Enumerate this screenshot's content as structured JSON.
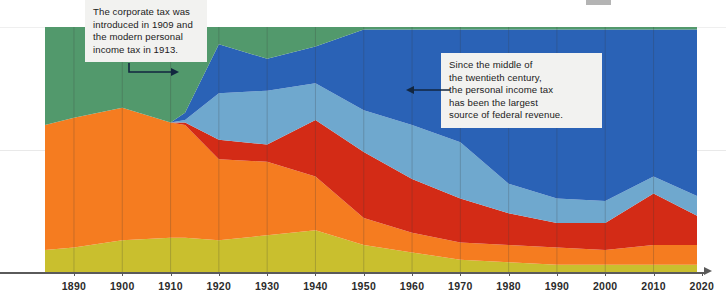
{
  "chart_data": {
    "type": "area",
    "title": "",
    "subtitle": "",
    "xlabel": "",
    "ylabel": "",
    "stacked": true,
    "grid": true,
    "legend_position": "none",
    "xlim": [
      1884,
      2019
    ],
    "ylim": [
      0,
      100
    ],
    "x": [
      1884,
      1890,
      1900,
      1910,
      1913,
      1920,
      1930,
      1940,
      1950,
      1960,
      1970,
      1980,
      1990,
      2000,
      2010,
      2019
    ],
    "tick_labels": [
      "1890",
      "1900",
      "1910",
      "1920",
      "1930",
      "1940",
      "1950",
      "1960",
      "1970",
      "1980",
      "1990",
      "2000",
      "2010",
      "2020"
    ],
    "ticks": [
      1890,
      1900,
      1910,
      1920,
      1930,
      1940,
      1950,
      1960,
      1970,
      1980,
      1990,
      2000,
      2010,
      2020
    ],
    "series": [
      {
        "name": "Excise taxes",
        "color": "#C9BF2E",
        "values": [
          9,
          10,
          13,
          14,
          14,
          13,
          15,
          17,
          11,
          8,
          5,
          4,
          3,
          3,
          3,
          3
        ]
      },
      {
        "name": "Customs duties and other",
        "color": "#F57C20",
        "values": [
          51,
          53,
          54,
          47,
          46,
          33,
          30,
          22,
          11,
          8,
          7,
          7,
          7,
          6,
          8,
          8
        ]
      },
      {
        "name": "Corporate income tax",
        "color": "#D32B16",
        "values": [
          0,
          0,
          0,
          0,
          1,
          8,
          7,
          23,
          27,
          22,
          18,
          13,
          10,
          11,
          21,
          12
        ]
      },
      {
        "name": "Payroll / social insurance taxes",
        "color": "#6FA8CE",
        "values": [
          0,
          0,
          0,
          0,
          1,
          19,
          22,
          15,
          17,
          22,
          23,
          12,
          10,
          9,
          7,
          8
        ]
      },
      {
        "name": "Personal income tax",
        "color": "#2A62B6",
        "values": [
          0,
          0,
          0,
          0,
          3,
          20,
          13,
          15,
          33,
          39,
          46,
          63,
          69,
          70,
          60,
          68
        ]
      },
      {
        "name": "Other receipts",
        "color": "#52996C",
        "values": [
          40,
          37,
          33,
          39,
          35,
          7,
          13,
          8,
          1,
          1,
          1,
          1,
          1,
          1,
          1,
          1
        ]
      }
    ]
  },
  "annotations": [
    {
      "id": "callout-1",
      "text": "The corporate tax was\nintroduced in 1909 and\nthe modern personal\nincome tax in 1913.",
      "arrow_direction": "right"
    },
    {
      "id": "callout-2",
      "text": "Since the middle of\nthe twentieth century,\nthe personal income tax\nhas been the largest\nsource of federal revenue.",
      "arrow_direction": "left"
    }
  ],
  "axis": {
    "arrow_color": "#5a5a5a"
  }
}
